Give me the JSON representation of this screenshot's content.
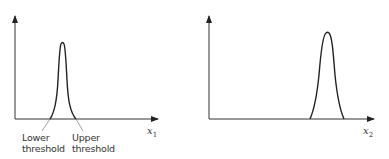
{
  "diagrams": [
    {
      "id": "left",
      "x_axis_label": "x",
      "x_axis_subscript": "1",
      "curve": "narrow sharp peak",
      "annotations": {
        "lower_threshold": [
          "Lower",
          "threshold"
        ],
        "upper_threshold": [
          "Upper",
          "threshold"
        ]
      }
    },
    {
      "id": "right",
      "x_axis_label": "x",
      "x_axis_subscript": "2",
      "curve": "wider bell-shaped peak"
    }
  ],
  "colors": {
    "line": "#222222",
    "leader": "#777777",
    "text": "#333333"
  }
}
